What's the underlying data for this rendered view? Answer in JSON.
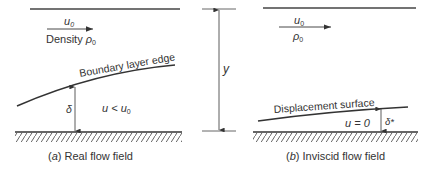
{
  "panel_a": {
    "velocity_label": "u",
    "velocity_sub": "0",
    "density_label": "Density ",
    "density_symbol": "ρ",
    "density_sub": "0",
    "edge_label": "Boundary layer edge",
    "delta_label": "δ",
    "inner_label_u": "u < u",
    "inner_label_sub": "0",
    "caption_prefix": "(",
    "caption_letter": "a",
    "caption_text": ") Real flow field"
  },
  "middle": {
    "y_label": "y"
  },
  "panel_b": {
    "velocity_label": "u",
    "velocity_sub": "0",
    "density_symbol": "ρ",
    "density_sub": "0",
    "surface_label": "Displacement surface",
    "inner_label": "u = 0",
    "delta_star_label": "δ*",
    "caption_prefix": "(",
    "caption_letter": "b",
    "caption_text": ") Inviscid flow field"
  },
  "colors": {
    "line": "#333333",
    "hatch": "#555555"
  }
}
